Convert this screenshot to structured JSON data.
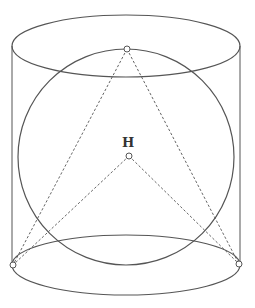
{
  "diagram": {
    "labels": {
      "center_point": "H"
    },
    "colors": {
      "stroke": "#555555",
      "background": "#ffffff"
    },
    "shapes": {
      "top_ellipse": {
        "cx": 126,
        "cy": 46,
        "rx": 114,
        "ry": 31
      },
      "bottom_ellipse": {
        "cx": 126,
        "cy": 265,
        "rx": 114,
        "ry": 30
      },
      "sphere_circle": {
        "cx": 126,
        "cy": 157,
        "r": 108
      },
      "apex_point": {
        "x": 127,
        "y": 49
      },
      "h_point": {
        "x": 129,
        "y": 156
      },
      "left_base_point": {
        "x": 13,
        "y": 265
      },
      "right_base_point": {
        "x": 239,
        "y": 264
      }
    }
  }
}
